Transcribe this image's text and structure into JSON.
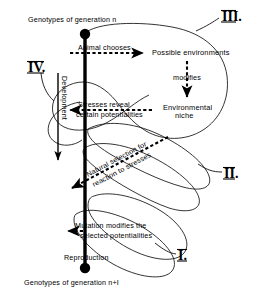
{
  "figure": {
    "title_top": "Genotypes of generation n",
    "title_bottom": "Genotypes of generation n+I",
    "background_color": "#ffffff",
    "ink_color": "#000000"
  },
  "axis": {
    "label": "Development",
    "top_node": "genotype-node-top",
    "bottom_node": "genotype-node-bottom"
  },
  "nodes": {
    "possible_environments": "Possible  environments",
    "environmental_niche_line1": "Environmental",
    "environmental_niche_line2": "niche",
    "reproduction": "Reproduction"
  },
  "arrows": [
    {
      "id": "animal-chooses",
      "label": "Animal chooses",
      "direction": "right"
    },
    {
      "id": "modifies",
      "label": "modifies",
      "direction": "down"
    },
    {
      "id": "stresses-reveal",
      "label_line1": "Stresses reveal",
      "label_line2": "certain potentialities",
      "direction": "left"
    },
    {
      "id": "natural-selection",
      "label_line1": "Natural selection for",
      "label_line2": "reaction to stresses",
      "direction": "down-left"
    },
    {
      "id": "mutation-modifies",
      "label_line1": "Mutation modifies the",
      "label_line2": "selected  potentialities",
      "direction": "left"
    }
  ],
  "numerals": {
    "one": "I.",
    "two": "II.",
    "three": "III.",
    "four": "IV."
  }
}
